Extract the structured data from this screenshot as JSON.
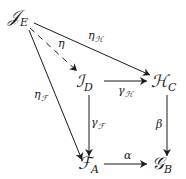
{
  "diagram": {
    "type": "commutative-diagram",
    "nodes": {
      "JE": {
        "base": "𝒥",
        "sub": "E"
      },
      "ID": {
        "base": "ℐ",
        "sub": "D"
      },
      "HC": {
        "base": "ℋ",
        "sub": "C"
      },
      "FA": {
        "base": "ℱ",
        "sub": "A"
      },
      "GB": {
        "base": "𝒢",
        "sub": "B"
      }
    },
    "arrows": {
      "eta": {
        "from": "JE",
        "to": "ID",
        "style": "dashed",
        "label": "η",
        "label_sub": ""
      },
      "eta_H": {
        "from": "JE",
        "to": "HC",
        "style": "solid",
        "label": "η",
        "label_sub": "ℋ"
      },
      "eta_F": {
        "from": "JE",
        "to": "FA",
        "style": "solid",
        "label": "η",
        "label_sub": "ℱ"
      },
      "gamma_H": {
        "from": "ID",
        "to": "HC",
        "style": "solid",
        "label": "γ",
        "label_sub": "ℋ"
      },
      "gamma_F": {
        "from": "ID",
        "to": "FA",
        "style": "solid",
        "label": "γ",
        "label_sub": "ℱ"
      },
      "beta": {
        "from": "HC",
        "to": "GB",
        "style": "solid",
        "label": "β",
        "label_sub": ""
      },
      "alpha": {
        "from": "FA",
        "to": "GB",
        "style": "solid",
        "label": "α",
        "label_sub": ""
      }
    }
  }
}
